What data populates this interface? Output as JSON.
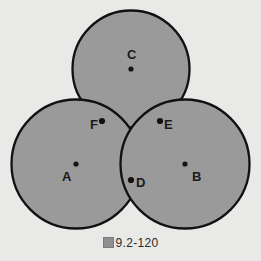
{
  "figure": {
    "caption_prefix": "图",
    "caption_number": "9.2-120",
    "background_color": "#e9e9e7",
    "fill_color": "#9a9a9a",
    "stroke_color": "#111111",
    "labels": {
      "center_a": "A",
      "center_b": "B",
      "center_c": "C",
      "tangent_d": "D",
      "tangent_e": "E",
      "tangent_f": "F"
    }
  },
  "chart_data": {
    "type": "diagram",
    "grid": false,
    "legend": null,
    "xlabel": "",
    "ylabel": "",
    "xlim": [
      0,
      261
    ],
    "ylim": [
      0,
      261
    ],
    "circles": [
      {
        "name": "A",
        "cx": 76,
        "cy": 164,
        "r": 64.5,
        "label": "A",
        "label_x": 62,
        "label_y": 178
      },
      {
        "name": "B",
        "cx": 185,
        "cy": 164,
        "r": 64.5,
        "label": "B",
        "label_x": 192,
        "label_y": 178
      },
      {
        "name": "C",
        "cx": 131,
        "cy": 69,
        "r": 58.5,
        "label": "C",
        "label_x": 127,
        "label_y": 55
      }
    ],
    "center_points": [
      {
        "name": "A",
        "x": 76,
        "y": 164
      },
      {
        "name": "B",
        "x": 185,
        "y": 164
      },
      {
        "name": "C",
        "x": 131,
        "y": 69
      }
    ],
    "tangency_points": [
      {
        "name": "D",
        "x": 131,
        "y": 180,
        "between": [
          "A",
          "B"
        ],
        "label_x": 136,
        "label_y": 182
      },
      {
        "name": "E",
        "x": 160,
        "y": 121,
        "between": [
          "B",
          "C"
        ],
        "label_x": 164,
        "label_y": 124
      },
      {
        "name": "F",
        "x": 102,
        "y": 121,
        "between": [
          "A",
          "C"
        ],
        "label_x": 92,
        "label_y": 124
      }
    ]
  }
}
